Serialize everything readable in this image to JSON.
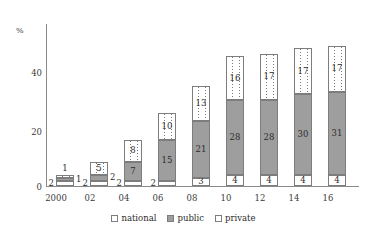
{
  "chart_data": {
    "type": "bar",
    "stacked": true,
    "title": "",
    "xlabel": "",
    "ylabel": "%",
    "ylim": [
      0,
      60
    ],
    "yticks": [
      0,
      20,
      40
    ],
    "ytick_labels": [
      "0",
      "20",
      "40"
    ],
    "grid": false,
    "legend_position": "bottom-center",
    "categories": [
      "2000",
      "02",
      "04",
      "06",
      "08",
      "10",
      "12",
      "14",
      "16"
    ],
    "series": [
      {
        "name": "national",
        "values": [
          2,
          2,
          2,
          2,
          3,
          4,
          4,
          4,
          4
        ]
      },
      {
        "name": "public",
        "values": [
          1,
          2,
          7,
          15,
          21,
          28,
          28,
          30,
          31
        ]
      },
      {
        "name": "private",
        "values": [
          1,
          5,
          8,
          10,
          13,
          16,
          17,
          17,
          17
        ]
      }
    ],
    "totals": [
      4,
      9,
      17,
      27,
      37,
      48,
      49,
      51,
      52
    ],
    "label_placement": {
      "2000": {
        "national": "outside-left",
        "public": "outside-right",
        "private": "outside-top"
      },
      "02": {
        "national": "outside-left",
        "public": "outside-right",
        "private": "inside"
      },
      "04": {
        "national": "outside-left",
        "public": "inside",
        "private": "inside"
      },
      "06": {
        "national": "outside-left",
        "public": "inside",
        "private": "inside"
      },
      "08": {
        "national": "inside",
        "public": "inside",
        "private": "inside"
      },
      "10": {
        "national": "inside",
        "public": "inside",
        "private": "inside"
      },
      "12": {
        "national": "inside",
        "public": "inside",
        "private": "inside"
      },
      "14": {
        "national": "inside",
        "public": "inside",
        "private": "inside"
      },
      "16": {
        "national": "inside",
        "public": "inside",
        "private": "inside"
      }
    },
    "colors": {
      "national": "#ffffff",
      "public": "#9e9e9e",
      "private": "#ffffff",
      "outline": "#7d7d7d",
      "axis": "#8a8a8a",
      "text": "#2b2b2b"
    }
  },
  "axes": {
    "y_unit_label": "%",
    "y_ticks": [
      "40",
      "20",
      "0"
    ],
    "x_ticks": [
      "2000",
      "02",
      "04",
      "06",
      "08",
      "10",
      "12",
      "14",
      "16"
    ]
  },
  "legend": {
    "items": [
      {
        "label": "national",
        "swatch": "empty-square"
      },
      {
        "label": "public",
        "swatch": "filled-gray-square"
      },
      {
        "label": "private",
        "swatch": "dotted-square"
      }
    ]
  }
}
